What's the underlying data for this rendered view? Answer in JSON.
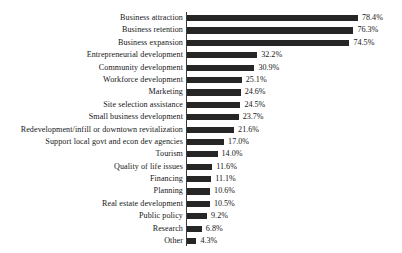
{
  "chart_data": {
    "type": "bar",
    "orientation": "horizontal",
    "title": "",
    "subtitle": "",
    "xlabel": "",
    "ylabel": "",
    "xlim": [
      0,
      80
    ],
    "grid": false,
    "legend": null,
    "value_suffix": "%",
    "bar_color": "#262626",
    "axis_color": "#3a3a3a",
    "background_color": "#ffffff",
    "categories": [
      "Business attraction",
      "Business retention",
      "Business expansion",
      "Entrepreneurial development",
      "Community development",
      "Workforce development",
      "Marketing",
      "Site selection assistance",
      "Small business development",
      "Redevelopment/infill or downtown revitalization",
      "Support local govt and econ dev agencies",
      "Tourism",
      "Quality of life issues",
      "Financing",
      "Planning",
      "Real estate development",
      "Public policy",
      "Research",
      "Other"
    ],
    "values": [
      78.4,
      76.3,
      74.5,
      32.2,
      30.9,
      25.1,
      24.6,
      24.5,
      23.7,
      21.6,
      17.0,
      14.0,
      11.6,
      11.1,
      10.6,
      10.5,
      9.2,
      6.8,
      4.3
    ],
    "value_labels": [
      "78.4%",
      "76.3%",
      "74.5%",
      "32.2%",
      "30.9%",
      "25.1%",
      "24.6%",
      "24.5%",
      "23.7%",
      "21.6%",
      "17.0%",
      "14.0%",
      "11.6%",
      "11.1%",
      "10.6%",
      "10.5%",
      "9.2%",
      "6.8%",
      "4.3%"
    ]
  }
}
